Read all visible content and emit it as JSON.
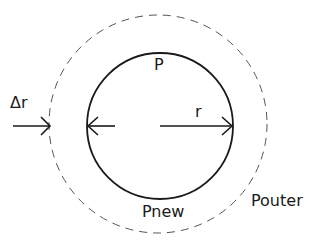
{
  "diagram": {
    "labels": {
      "inner": "P",
      "radius": "r",
      "delta": "Δr",
      "new": "Pnew",
      "outer": "Pouter"
    },
    "colors": {
      "line": "#1a1a1a",
      "dashed": "#555555",
      "background": "#ffffff"
    },
    "shapes": {
      "inner_circle": {
        "cx": 160,
        "cy": 126,
        "r": 73,
        "style": "solid"
      },
      "outer_circle": {
        "cx": 158,
        "cy": 124,
        "r": 110,
        "style": "dashed"
      }
    }
  }
}
